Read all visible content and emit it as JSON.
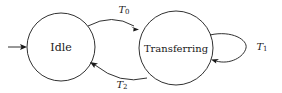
{
  "diagram": {
    "type": "state-machine-diagram",
    "background_color": "#ffffff",
    "stroke_color": "#1a1a1a",
    "nodes": [
      {
        "id": "idle",
        "label": "Idle",
        "shape": "circle",
        "cx": 61,
        "cy": 47,
        "r": 34
      },
      {
        "id": "transferring",
        "label": "Transferring",
        "shape": "circle",
        "cx": 176,
        "cy": 48,
        "r": 37
      }
    ],
    "edges": [
      {
        "id": "t0",
        "from": "idle",
        "to": "transferring",
        "label_base": "T",
        "label_sub": "0",
        "label_full": "T0",
        "position": "above"
      },
      {
        "id": "t2",
        "from": "transferring",
        "to": "idle",
        "label_base": "T",
        "label_sub": "2",
        "label_full": "T2",
        "position": "below"
      },
      {
        "id": "t1",
        "from": "transferring",
        "to": "transferring",
        "label_base": "T",
        "label_sub": "1",
        "label_full": "T1",
        "position": "right",
        "self_loop": true
      }
    ],
    "entry_arrow": {
      "id": "start",
      "label": "",
      "target": "idle"
    }
  }
}
